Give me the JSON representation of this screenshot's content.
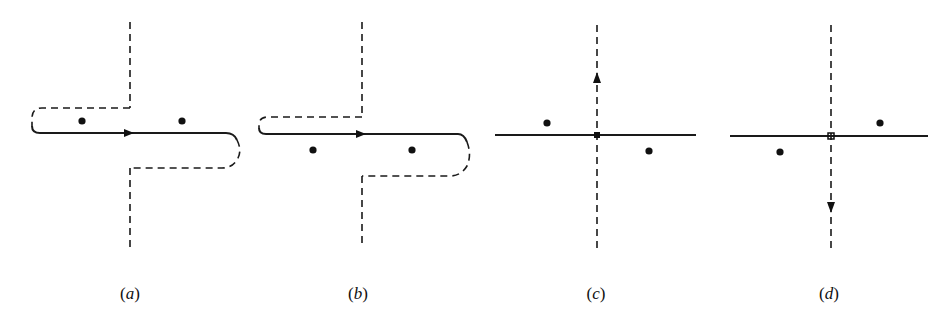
{
  "figure": {
    "colors": {
      "stroke": "#1a1a1a",
      "background": "#ffffff"
    },
    "panels": [
      {
        "id": "a",
        "label": "(a)",
        "label_letter": "a",
        "contour": "solid real axis traversed left-to-right with arrow, closed by dashed detour: from left end up and over to vertical dashed line going up; from right end down and back to vertical dashed line going down",
        "arrow": "right",
        "poles": [
          {
            "x": 82,
            "y": 121,
            "side": "above"
          },
          {
            "x": 182,
            "y": 121,
            "side": "above"
          }
        ]
      },
      {
        "id": "b",
        "label": "(b)",
        "label_letter": "b",
        "contour": "solid real axis traversed left-to-right with arrow, dashed detour as in (a)",
        "arrow": "right",
        "poles": [
          {
            "x": 313,
            "y": 150,
            "side": "below"
          },
          {
            "x": 412,
            "y": 150,
            "side": "below"
          }
        ]
      },
      {
        "id": "c",
        "label": "(c)",
        "label_letter": "c",
        "contour": "solid horizontal real axis, dashed vertical line through origin with upward arrow",
        "arrow": "up",
        "poles": [
          {
            "x": 547,
            "y": 123,
            "side": "upper-left"
          },
          {
            "x": 649,
            "y": 151,
            "side": "lower-right"
          }
        ]
      },
      {
        "id": "d",
        "label": "(d)",
        "label_letter": "d",
        "contour": "solid horizontal real axis, dashed vertical line through origin with downward arrow",
        "arrow": "down",
        "poles": [
          {
            "x": 780,
            "y": 152,
            "side": "lower-left"
          },
          {
            "x": 880,
            "y": 123,
            "side": "upper-right"
          }
        ]
      }
    ]
  }
}
